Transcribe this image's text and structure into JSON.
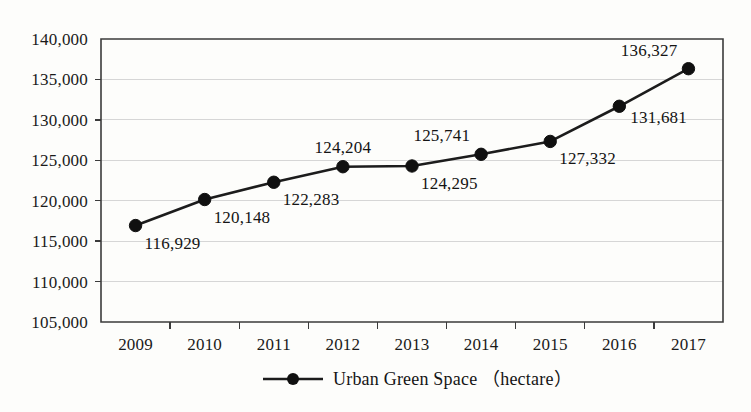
{
  "chart_data": {
    "type": "line",
    "title": "",
    "xlabel": "",
    "ylabel": "",
    "categories": [
      "2009",
      "2010",
      "2011",
      "2012",
      "2013",
      "2014",
      "2015",
      "2016",
      "2017"
    ],
    "values": [
      116929,
      120148,
      122283,
      124204,
      124295,
      125741,
      127332,
      131681,
      136327
    ],
    "point_labels": [
      "116,929",
      "120,148",
      "122,283",
      "124,204",
      "124,295",
      "125,741",
      "127,332",
      "131,681",
      "136,327"
    ],
    "label_placement": [
      "below-right",
      "below-right",
      "below-right",
      "above-center",
      "below-right",
      "above-left",
      "below-right",
      "right-below",
      "above-left"
    ],
    "ylim": [
      105000,
      140000
    ],
    "ytick_values": [
      105000,
      110000,
      115000,
      120000,
      125000,
      130000,
      135000,
      140000
    ],
    "ytick_labels": [
      "105,000",
      "110,000",
      "115,000",
      "120,000",
      "125,000",
      "130,000",
      "135,000",
      "140,000"
    ],
    "grid": true,
    "grid_axis": "y",
    "legend_position": "bottom-center",
    "series": [
      {
        "name": "Urban Green Space （hectare）",
        "marker": "circle",
        "color": "#101010",
        "values": [
          116929,
          120148,
          122283,
          124204,
          124295,
          125741,
          127332,
          131681,
          136327
        ]
      }
    ]
  },
  "legend": {
    "label": "Urban Green Space （hectare）"
  },
  "colors": {
    "line": "#1c1c1c",
    "marker": "#101010",
    "grid": "#d6d6d6",
    "axis": "#3b3b3b",
    "background": "#fdfdfb",
    "text": "#141414"
  }
}
